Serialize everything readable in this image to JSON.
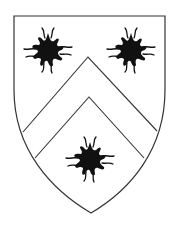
{
  "image": {
    "subject": "heraldic shield",
    "field_color": "#ffffff",
    "outline_color": "#333333",
    "charge_color": "#111111"
  },
  "shield": {
    "charges": [
      {
        "name": "sun-in-splendour",
        "position": "chief-dexter",
        "cx": 48,
        "cy": 50
      },
      {
        "name": "sun-in-splendour",
        "position": "chief-sinister",
        "cx": 131,
        "cy": 50
      },
      {
        "name": "sun-in-splendour",
        "position": "base",
        "cx": 90,
        "cy": 158
      }
    ],
    "ordinary": "chevron"
  }
}
